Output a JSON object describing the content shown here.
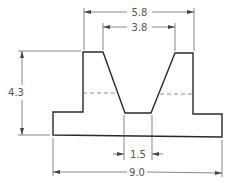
{
  "drawing": {
    "type": "engineering-section-profile",
    "dimensions": [
      {
        "id": "top-outer-width",
        "label": "5.8"
      },
      {
        "id": "top-inner-width",
        "label": "3.8"
      },
      {
        "id": "overall-height",
        "label": "4.3"
      },
      {
        "id": "notch-bottom-width",
        "label": "1.5"
      },
      {
        "id": "overall-width",
        "label": "9.0"
      }
    ],
    "colors": {
      "outline": "#2a2a2a",
      "dimension": "#555555",
      "background": "#ffffff"
    }
  }
}
